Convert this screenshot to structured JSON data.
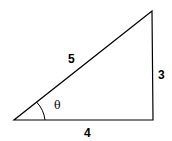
{
  "diagram": {
    "type": "right-triangle",
    "labels": {
      "hypotenuse": "5",
      "opposite": "3",
      "adjacent": "4",
      "angle": "θ"
    },
    "stroke_color": "#000000",
    "background": "#ffffff"
  }
}
